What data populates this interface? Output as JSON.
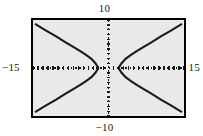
{
  "screen": {
    "title": "Graphing calculator viewport",
    "background_color": "#ffffff",
    "plot_background_color": "#e9e9e9",
    "frame_color": "#000000",
    "curve_color": "#1a1a1a",
    "axis_color": "#1a1a1a"
  },
  "labels": {
    "ymax": "10",
    "ymin": "−10",
    "xmin": "−15",
    "xmax": "15"
  },
  "chart_data": {
    "type": "line",
    "title": "",
    "xlabel": "",
    "ylabel": "",
    "xlim": [
      -15,
      15
    ],
    "ylim": [
      -10,
      10
    ],
    "xtick_labels": [
      "−15",
      "15"
    ],
    "ytick_labels": [
      "−10",
      "10"
    ],
    "xtick_step": 1,
    "ytick_step": 1,
    "grid": false,
    "axes_style": "dotted-with-tick-marks",
    "axis_x_position": 0,
    "axis_y_position": 0,
    "legend": null,
    "series": [
      {
        "name": "left branch (upper)",
        "x": [
          -2.0,
          -2.6,
          -3.4,
          -4.4,
          -5.6,
          -7.0,
          -8.6,
          -10.4,
          -12.4,
          -14.6
        ],
        "y": [
          0.0,
          1.0,
          1.9,
          2.7,
          3.5,
          4.4,
          5.4,
          6.6,
          7.8,
          9.2
        ]
      },
      {
        "name": "left branch (lower)",
        "x": [
          -2.0,
          -2.6,
          -3.4,
          -4.4,
          -5.6,
          -7.0,
          -8.6,
          -10.4,
          -12.4,
          -14.6
        ],
        "y": [
          0.0,
          -1.0,
          -1.9,
          -2.7,
          -3.5,
          -4.4,
          -5.4,
          -6.6,
          -7.8,
          -9.2
        ]
      },
      {
        "name": "right branch (upper)",
        "x": [
          2.0,
          2.6,
          3.4,
          4.4,
          5.6,
          7.0,
          8.6,
          10.4,
          12.4,
          14.6
        ],
        "y": [
          0.0,
          1.0,
          1.9,
          2.7,
          3.5,
          4.4,
          5.4,
          6.6,
          7.8,
          9.2
        ]
      },
      {
        "name": "right branch (lower)",
        "x": [
          2.0,
          2.6,
          3.4,
          4.4,
          5.6,
          7.0,
          8.6,
          10.4,
          12.4,
          14.6
        ],
        "y": [
          0.0,
          -1.0,
          -1.9,
          -2.7,
          -3.5,
          -4.4,
          -5.4,
          -6.6,
          -7.8,
          -9.2
        ]
      }
    ]
  }
}
